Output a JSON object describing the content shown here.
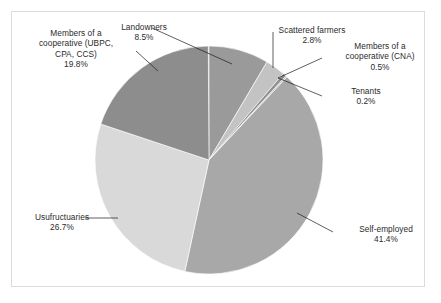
{
  "figure": {
    "background": "#ffffff",
    "border_color": "#dcdcdc"
  },
  "chart_data": {
    "type": "pie",
    "title": "",
    "subtitle": "",
    "xlabel": "",
    "ylabel": "",
    "legend": "none",
    "grid": false,
    "labels_position": "outside-with-leader-lines",
    "start_angle_deg": 0,
    "direction": "clockwise",
    "categories": [
      "Landowners",
      "Scattered farmers",
      "Members of a cooperative (CNA)",
      "Tenants",
      "Self-employed",
      "Usufructuaries",
      "Members of a cooperative (UBPC, CPA, CCS)"
    ],
    "values": [
      8.5,
      2.8,
      0.5,
      0.2,
      41.4,
      26.7,
      19.8
    ],
    "units": "%",
    "total": 99.9,
    "slices": [
      {
        "name": "Landowners",
        "value": 8.5,
        "value_label": "8.5%",
        "color": "#9a9a9a",
        "start_deg": 0.0,
        "end_deg": 30.6
      },
      {
        "name": "Scattered farmers",
        "value": 2.8,
        "value_label": "2.8%",
        "color": "#c3c3c3",
        "start_deg": 30.6,
        "end_deg": 40.68
      },
      {
        "name": "Members of a cooperative (CNA)",
        "value": 0.5,
        "value_label": "0.5%",
        "color": "#8f8f8f",
        "start_deg": 40.68,
        "end_deg": 42.48
      },
      {
        "name": "Tenants",
        "value": 0.2,
        "value_label": "0.2%",
        "color": "#b8b8b8",
        "start_deg": 42.48,
        "end_deg": 43.2
      },
      {
        "name": "Self-employed",
        "value": 41.4,
        "value_label": "41.4%",
        "color": "#a8a8a8",
        "start_deg": 43.2,
        "end_deg": 192.24
      },
      {
        "name": "Usufructuaries",
        "value": 26.7,
        "value_label": "26.7%",
        "color": "#d9d9d9",
        "start_deg": 192.24,
        "end_deg": 288.36
      },
      {
        "name": "Members of a cooperative (UBPC, CPA, CCS)",
        "value": 19.8,
        "value_label": "19.8%",
        "color": "#8d8d8d",
        "start_deg": 288.36,
        "end_deg": 359.64
      }
    ]
  },
  "labels": {
    "ubpc": {
      "line1": "Members of a",
      "line2": "cooperative (UBPC,",
      "line3": "CPA, CCS)",
      "value": "19.8%"
    },
    "landowners": {
      "name": "Landowners",
      "value": "8.5%"
    },
    "scattered": {
      "name": "Scattered farmers",
      "value": "2.8%"
    },
    "cna": {
      "line1": "Members of a",
      "line2": "cooperative (CNA)",
      "value": "0.5%"
    },
    "tenants": {
      "name": "Tenants",
      "value": "0.2%"
    },
    "usufructuaries": {
      "name": "Usufructuaries",
      "value": "26.7%"
    },
    "self_employed": {
      "name": "Self-employed",
      "value": "41.4%"
    }
  }
}
